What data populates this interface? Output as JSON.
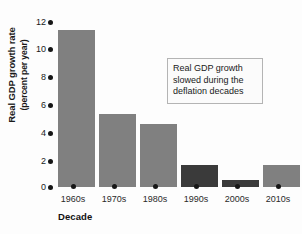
{
  "chart_data": {
    "type": "bar",
    "title": "",
    "xlabel": "Decade",
    "ylabel_line1": "Real GDP growth rate",
    "ylabel_line2": "(percent per year)",
    "categories": [
      "1960s",
      "1970s",
      "1980s",
      "1990s",
      "2000s",
      "2010s"
    ],
    "values": [
      10.9,
      5.1,
      4.4,
      1.5,
      0.5,
      1.5
    ],
    "ylim": [
      0,
      12
    ],
    "yticks": [
      12,
      10,
      8,
      6,
      4,
      2,
      0
    ],
    "ytick_labels": [
      "12",
      "10",
      "8",
      "6",
      "4",
      "2",
      "0"
    ],
    "grid": false,
    "legend": false,
    "bar_colors": [
      "#808080",
      "#808080",
      "#808080",
      "#3a3a3a",
      "#3a3a3a",
      "#808080"
    ],
    "annotations": [
      {
        "line1": "Real GDP growth",
        "line2": "slowed during the",
        "line3": "deflation decades"
      }
    ]
  },
  "colors": {
    "bar_light": "#808080",
    "bar_dark": "#3a3a3a",
    "text": "#1a1a1a",
    "annotation_border": "#b4b4b4",
    "background": "#ffffff"
  }
}
